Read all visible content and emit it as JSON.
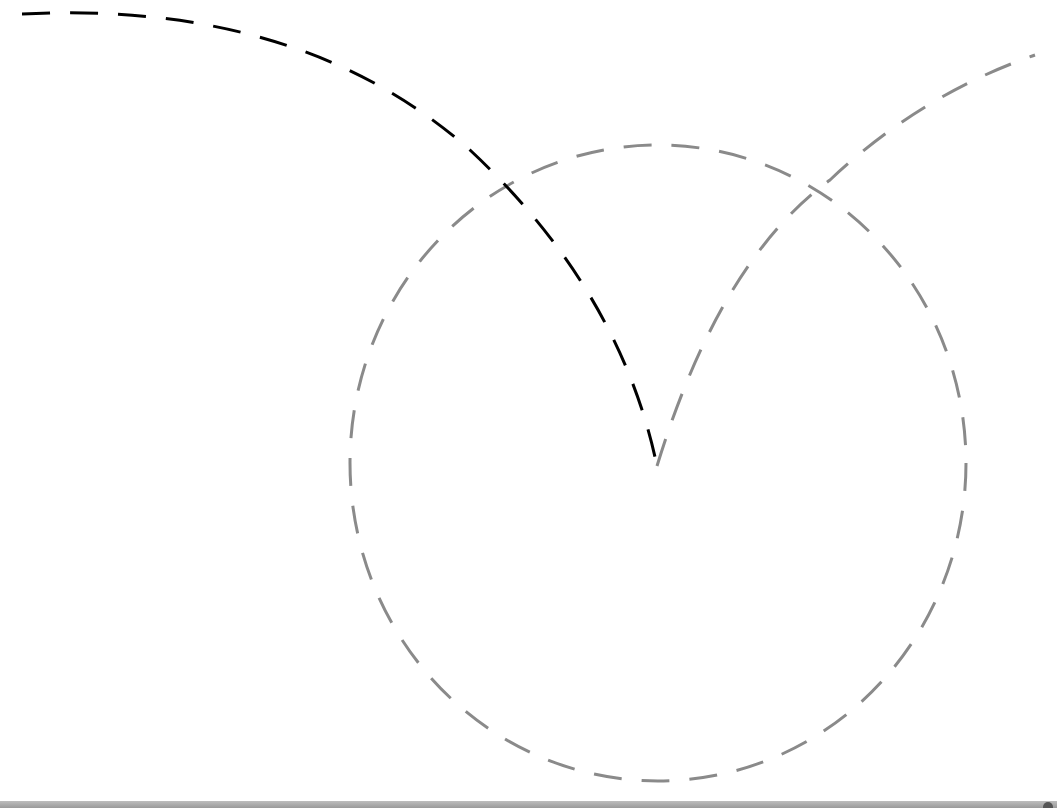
{
  "drawing": {
    "colors": {
      "gray": "#8a8a8a",
      "black": "#000000",
      "background": "#ffffff"
    },
    "stroke_width": 3,
    "dash_pattern": "28,20",
    "circle": {
      "cx": 658,
      "cy": 463,
      "rx": 308,
      "ry": 318,
      "color": "#8a8a8a"
    },
    "black_arc": {
      "d": "M 22 14 Q 300 0 470 150 Q 620 290 657 466",
      "color": "#000000"
    },
    "gray_arc": {
      "d": "M 657 466 Q 720 260 830 180 Q 920 95 1035 55",
      "color": "#8a8a8a"
    }
  },
  "bottom_bar": {
    "visible": true
  }
}
